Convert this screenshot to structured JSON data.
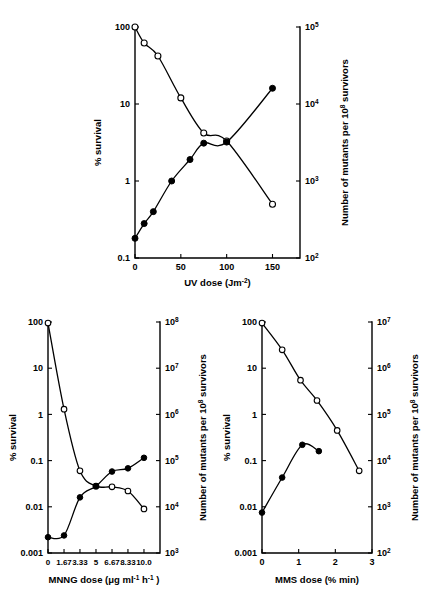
{
  "figure": {
    "background": "#ffffff",
    "ink_color": "#000000",
    "panel_count": 3
  },
  "chart_data": [
    {
      "id": "uv-panel",
      "type": "line",
      "title": "",
      "xlabel": "UV dose  (Jm-2)",
      "xlabel_parts": {
        "text": "UV dose  (Jm",
        "sup": "-2",
        "tail": ")"
      },
      "ylabel_left": "% survival",
      "ylabel_right": "Number of mutants per 10",
      "ylabel_right_sup": "8",
      "ylabel_right_tail": " survivors",
      "xlim": [
        0,
        180
      ],
      "xticks": [
        0,
        50,
        100,
        150
      ],
      "xticklabels": [
        "0",
        "50",
        "100",
        "150"
      ],
      "ylim_left": [
        0.1,
        100
      ],
      "yticks_left": [
        0.1,
        1,
        10,
        100
      ],
      "yticklabels_left": [
        "0.1",
        "1",
        "10",
        "100"
      ],
      "ylim_right": [
        100,
        100000
      ],
      "yticks_right": [
        100,
        1000,
        10000,
        100000
      ],
      "yticklabels_right": [
        "10",
        "10",
        "10",
        "10"
      ],
      "yticklabels_right_sup": [
        "2",
        "3",
        "4",
        "5"
      ],
      "grid": false,
      "legend": "none",
      "series": [
        {
          "name": "% survival",
          "marker": "open-circle",
          "axis": "left",
          "x": [
            0,
            10,
            25,
            50,
            75,
            100,
            150
          ],
          "values": [
            100,
            62,
            42,
            12,
            4.2,
            3.3,
            0.5
          ]
        },
        {
          "name": "Number of mutants per 10^8 survivors",
          "marker": "closed-circle",
          "axis": "right",
          "x": [
            0,
            10,
            20,
            40,
            60,
            75,
            100,
            150
          ],
          "values": [
            180,
            280,
            400,
            1000,
            1900,
            3100,
            3200,
            16000
          ]
        }
      ]
    },
    {
      "id": "mnng-panel",
      "type": "line",
      "title": "",
      "xlabel": "MNNG dose (μg ml-1 h-1)",
      "xlabel_parts": {
        "lead": "MNNG dose (",
        "mu": "μ",
        "mid": "g ml",
        "sup1": "-1",
        "mid2": "  h",
        "sup2": "-1",
        "tail": " )"
      },
      "ylabel_left": "% survival",
      "ylabel_right": "Number of mutants per 10",
      "ylabel_right_sup": "8",
      "ylabel_right_tail": " survivors",
      "xlim": [
        0,
        11.67
      ],
      "xticks": [
        0,
        1.67,
        3.33,
        5,
        6.67,
        8.33,
        10.0
      ],
      "xticklabels": [
        "0",
        "1.67",
        "3.33",
        "5",
        "6.67",
        "8.33",
        "10.0"
      ],
      "ylim_left": [
        0.001,
        100
      ],
      "yticks_left": [
        0.001,
        0.01,
        0.1,
        1,
        10,
        100
      ],
      "yticklabels_left": [
        "0.001",
        "0.01",
        "0.1",
        "1",
        "10",
        "100"
      ],
      "ylim_right": [
        1000,
        100000000
      ],
      "yticks_right": [
        1000,
        10000,
        100000,
        1000000,
        10000000,
        100000000
      ],
      "yticklabels_right": [
        "10",
        "10",
        "10",
        "10",
        "10",
        "10"
      ],
      "yticklabels_right_sup": [
        "3",
        "4",
        "5",
        "6",
        "7",
        "8"
      ],
      "grid": false,
      "legend": "none",
      "series": [
        {
          "name": "% survival",
          "marker": "open-circle",
          "axis": "left",
          "x": [
            0,
            1.67,
            3.33,
            5,
            6.67,
            8.33,
            10.0
          ],
          "values": [
            95,
            1.3,
            0.06,
            0.028,
            0.027,
            0.022,
            0.009
          ]
        },
        {
          "name": "Number of mutants per 10^8 survivors",
          "marker": "closed-circle",
          "axis": "right",
          "x": [
            0,
            1.67,
            3.33,
            5,
            6.67,
            8.33,
            10.0
          ],
          "values": [
            2200,
            2400,
            16000,
            28000,
            58000,
            68000,
            115000
          ]
        }
      ]
    },
    {
      "id": "mms-panel",
      "type": "line",
      "title": "",
      "xlabel": "MMS dose (% min)",
      "ylabel_left": "% survival",
      "ylabel_right": "Number of mutants per 10",
      "ylabel_right_sup": "8",
      "ylabel_right_tail": " survivors",
      "xlim": [
        0,
        3
      ],
      "xticks": [
        0,
        1,
        2,
        3
      ],
      "xticklabels": [
        "0",
        "1",
        "2",
        "3"
      ],
      "ylim_left": [
        0.001,
        100
      ],
      "yticks_left": [
        0.001,
        0.01,
        0.1,
        1,
        10,
        100
      ],
      "yticklabels_left": [
        "0.001",
        "0.01",
        "0.1",
        "1",
        "10",
        "100"
      ],
      "ylim_right": [
        100,
        10000000
      ],
      "yticks_right": [
        100,
        1000,
        10000,
        100000,
        1000000,
        10000000
      ],
      "yticklabels_right": [
        "10",
        "10",
        "10",
        "10",
        "10",
        "10"
      ],
      "yticklabels_right_sup": [
        "2",
        "3",
        "4",
        "5",
        "6",
        "7"
      ],
      "grid": false,
      "legend": "none",
      "series": [
        {
          "name": "% survival",
          "marker": "open-circle",
          "axis": "left",
          "x": [
            0,
            0.55,
            1.05,
            1.5,
            2.05,
            2.65
          ],
          "values": [
            95,
            25,
            5.5,
            2.0,
            0.45,
            0.06
          ]
        },
        {
          "name": "Number of mutants per 10^8 survivors",
          "marker": "closed-circle",
          "axis": "right",
          "x": [
            0,
            0.55,
            1.1,
            1.55
          ],
          "values": [
            750,
            4300,
            22000,
            16000
          ]
        }
      ]
    }
  ]
}
